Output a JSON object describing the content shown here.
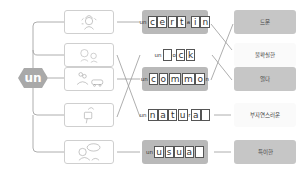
{
  "prefix": {
    "label": "un",
    "color": "#a9a9a9"
  },
  "images": [
    {
      "name": "confused-person-illustration"
    },
    {
      "name": "faces-illustration"
    },
    {
      "name": "crowd-car-illustration"
    },
    {
      "name": "lock-key-illustration"
    },
    {
      "name": "speech-bubble-animal-illustration"
    }
  ],
  "words": [
    {
      "prefix": "un",
      "letters": [
        "c",
        "e",
        "r",
        "t",
        "a",
        "i",
        "n"
      ],
      "small": [
        4
      ],
      "shaded": true
    },
    {
      "prefix": "un",
      "letters": [
        "l",
        "o",
        "c",
        "k"
      ],
      "small": [
        1
      ],
      "blank": [
        0
      ],
      "shaded": false
    },
    {
      "prefix": "un",
      "letters": [
        "c",
        "o",
        "m",
        "m",
        "o",
        "n"
      ],
      "small": [
        5
      ],
      "shaded": true
    },
    {
      "prefix": "un",
      "letters": [
        "n",
        "a",
        "t",
        "u",
        "r",
        "a",
        "l"
      ],
      "small": [
        4
      ],
      "blank": [
        6
      ],
      "shaded": false
    },
    {
      "prefix": "un",
      "letters": [
        "u",
        "s",
        "u",
        "a",
        "l"
      ],
      "blank": [
        4
      ],
      "shaded": true
    }
  ],
  "meanings": [
    {
      "label": "드문",
      "shaded": true
    },
    {
      "label": "불확실한",
      "shaded": false
    },
    {
      "label": "열다",
      "shaded": true
    },
    {
      "label": "부자연스러운",
      "shaded": false
    },
    {
      "label": "특이한",
      "shaded": true
    }
  ],
  "connections": {
    "image_to_word": [
      [
        0,
        0
      ],
      [
        1,
        3
      ],
      [
        2,
        2
      ],
      [
        3,
        1
      ],
      [
        4,
        4
      ]
    ],
    "word_to_meaning": [
      [
        0,
        1
      ],
      [
        1,
        2
      ],
      [
        2,
        0
      ],
      [
        3,
        3
      ],
      [
        4,
        4
      ]
    ]
  }
}
